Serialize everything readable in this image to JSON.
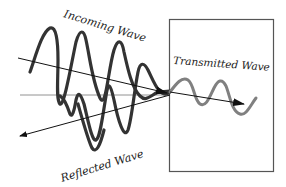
{
  "diagram": {
    "labels": {
      "incoming": "Incoming Wave",
      "transmitted": "Transmitted Wave",
      "reflected": "Reflected Wave"
    },
    "colors": {
      "incoming_wave": "#333333",
      "reflected_wave": "#333333",
      "transmitted_wave": "#808080",
      "arrows": "#111111",
      "boundary_box": "#555555",
      "text": "#222222"
    },
    "elements": [
      {
        "id": "boundary-box",
        "type": "rectangle",
        "label": "medium"
      },
      {
        "id": "incoming-arrow",
        "type": "arrow",
        "direction": "toward boundary"
      },
      {
        "id": "reflected-arrow",
        "type": "arrow",
        "direction": "away from boundary"
      },
      {
        "id": "transmitted-arrow",
        "type": "arrow",
        "direction": "into medium"
      },
      {
        "id": "normal-line",
        "type": "line",
        "orientation": "horizontal"
      }
    ]
  }
}
